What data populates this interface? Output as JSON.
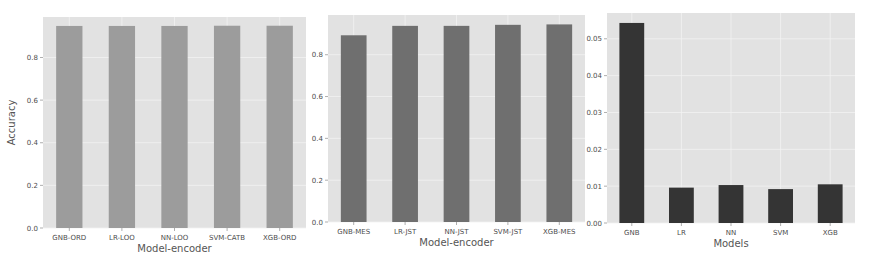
{
  "colors": {
    "axes_background": "#e2e2e2",
    "grid": "#f2f2f2",
    "page_background": "#ffffff"
  },
  "chart_data": [
    {
      "type": "bar",
      "title": "",
      "xlabel": "Model-encoder",
      "ylabel": "Accuracy",
      "categories": [
        "GNB-ORD",
        "LR-LOO",
        "NN-LOO",
        "SVM-CATB",
        "XGB-ORD"
      ],
      "values": [
        0.948,
        0.948,
        0.948,
        0.949,
        0.949
      ],
      "ylim": [
        0,
        0.99
      ],
      "yticks": [
        0.0,
        0.2,
        0.4,
        0.6,
        0.8
      ],
      "ytick_labels": [
        "0.0",
        "0.2",
        "0.4",
        "0.6",
        "0.8"
      ],
      "bar_color": "#9c9c9c",
      "grid": true,
      "legend": "none"
    },
    {
      "type": "bar",
      "title": "",
      "xlabel": "Model-encoder",
      "ylabel": "",
      "categories": [
        "GNB-MES",
        "LR-JST",
        "NN-JST",
        "SVM-JST",
        "XGB-MES"
      ],
      "values": [
        0.893,
        0.938,
        0.938,
        0.943,
        0.945
      ],
      "ylim": [
        0,
        0.99
      ],
      "yticks": [
        0.0,
        0.2,
        0.4,
        0.6,
        0.8
      ],
      "ytick_labels": [
        "0.0",
        "0.2",
        "0.4",
        "0.6",
        "0.8"
      ],
      "bar_color": "#6f6f6f",
      "grid": true,
      "legend": "none"
    },
    {
      "type": "bar",
      "title": "",
      "xlabel": "Models",
      "ylabel": "",
      "categories": [
        "GNB",
        "LR",
        "NN",
        "SVM",
        "XGB"
      ],
      "values": [
        0.0543,
        0.0096,
        0.0103,
        0.0092,
        0.0105
      ],
      "ylim": [
        0,
        0.057
      ],
      "yticks": [
        0.0,
        0.01,
        0.02,
        0.03,
        0.04,
        0.05
      ],
      "ytick_labels": [
        "0.00",
        "0.01",
        "0.02",
        "0.03",
        "0.04",
        "0.05"
      ],
      "bar_color": "#343434",
      "grid": true,
      "legend": "none"
    }
  ]
}
